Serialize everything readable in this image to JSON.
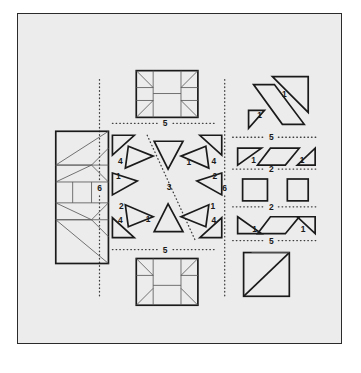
{
  "figure": {
    "caption": "",
    "plate": {
      "background_color": "#ececec",
      "border_color": "#2b2b2b",
      "stroke_color": "#1a1a1a",
      "thin_stroke_color": "#5a5a5a",
      "dotted_color": "#3d3d3d"
    },
    "labels": {
      "divider_left_vertical": "6",
      "divider_right_vertical": "6",
      "divider_top_horizontal": "5",
      "divider_bottom_horizontal": "5",
      "divider_right_upper": "5",
      "divider_right_mid_upper": "2",
      "divider_right_mid_lower": "2",
      "divider_right_lower": "5",
      "center_axis": "3"
    },
    "panels": [
      {
        "name": "left-panel",
        "description": "tall subdivided rectangle",
        "piece_labels": []
      },
      {
        "name": "center-panel",
        "description": "radial arrangement of triangles around a diagonal axis",
        "piece_labels": [
          "4",
          "1",
          "1",
          "4",
          "1",
          "2",
          "2",
          "1",
          "4",
          "1",
          "1",
          "4"
        ]
      },
      {
        "name": "right-panel",
        "description": "column of triangles, parallelograms and squares",
        "piece_labels": [
          "1",
          "1",
          "1",
          "1",
          "1",
          "1"
        ]
      },
      {
        "name": "top-center-rectangle",
        "description": "assembled rectangle with corner triangles",
        "piece_labels": []
      },
      {
        "name": "bottom-center-rectangle",
        "description": "assembled rectangle with corner triangles",
        "piece_labels": []
      },
      {
        "name": "bottom-right-square",
        "description": "square crossed by a diagonal",
        "piece_labels": []
      }
    ],
    "center_piece_numbers": {
      "top_inner": "1",
      "top_right_outer": "4",
      "top_left_outer": "4",
      "left_upper": "1",
      "left_lower": "2",
      "right_upper": "2",
      "right_lower": "1",
      "bottom_inner": "1",
      "bottom_left_outer": "4",
      "bottom_right_outer": "4",
      "axis": "3"
    },
    "right_piece_numbers": {
      "big_triangle": "1",
      "small_triangle": "1",
      "row1_left": "1",
      "row1_right": "1",
      "row2_left": "1",
      "row2_right": "1"
    }
  }
}
